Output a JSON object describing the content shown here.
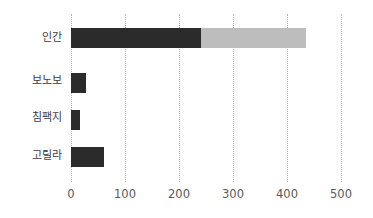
{
  "chart_data": {
    "type": "bar",
    "orientation": "horizontal",
    "stacked": true,
    "title": "",
    "subtitle": "",
    "xlabel": "",
    "ylabel": "",
    "categories": [
      "인간",
      "보노보",
      "침팩지",
      "고릴라"
    ],
    "series": [
      {
        "name": "segment-1",
        "color": "#2b2b2b",
        "values": [
          240,
          28,
          17,
          62
        ]
      },
      {
        "name": "segment-2",
        "color": "#bdbdbd",
        "values": [
          195,
          0,
          0,
          0
        ]
      }
    ],
    "totals": [
      435,
      28,
      17,
      62
    ],
    "xlim": [
      0,
      500
    ],
    "xticks": [
      0,
      100,
      200,
      300,
      400,
      500
    ],
    "xtick_labels": [
      "0",
      "100",
      "200",
      "300",
      "400",
      "500"
    ],
    "grid": true,
    "grid_style": "dotted",
    "grid_color": "#b5b5b5",
    "legend": "none",
    "background": "#ffffff"
  },
  "axis": {
    "tick_labels": [
      "0",
      "100",
      "200",
      "300",
      "400",
      "500"
    ]
  },
  "categories": {
    "labels": [
      "인간",
      "보노보",
      "침팩지",
      "고릴라"
    ]
  }
}
